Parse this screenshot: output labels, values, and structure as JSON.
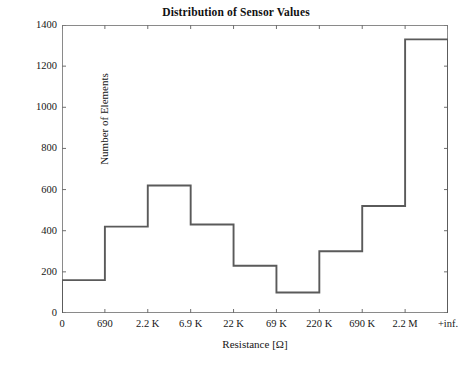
{
  "figure": {
    "title": "Distribution of Sensor Values",
    "background_color": "#ffffff",
    "line_color": "#5a5a5a",
    "frame_color": "#8a8a8a",
    "text_color": "#161616"
  },
  "chart_data": {
    "type": "bar",
    "title": "Distribution of Sensor Values",
    "xlabel": "Resistance [Ω]",
    "ylabel": "Number of Elements",
    "subtitle": "",
    "style": "step-histogram",
    "grid": false,
    "legend": null,
    "xlim": [
      0,
      9
    ],
    "ylim": [
      0,
      1400
    ],
    "yticks": [
      0,
      200,
      400,
      600,
      800,
      1000,
      1200,
      1400
    ],
    "ytick_labels": [
      "0",
      "200",
      "400",
      "600",
      "800",
      "1000",
      "1200",
      "1400"
    ],
    "bin_edges": [
      "0",
      "690",
      "2.2 K",
      "6.9 K",
      "22 K",
      "69 K",
      "220 K",
      "690 K",
      "2.2 M",
      "+inf."
    ],
    "categories": [
      "0–690",
      "690–2.2 K",
      "2.2 K–6.9 K",
      "6.9 K–22 K",
      "22 K–69 K",
      "69 K–220 K",
      "220 K–690 K",
      "690 K–2.2 M",
      "2.2 M–+inf."
    ],
    "values": [
      160,
      420,
      620,
      430,
      230,
      100,
      300,
      520,
      1330
    ]
  }
}
